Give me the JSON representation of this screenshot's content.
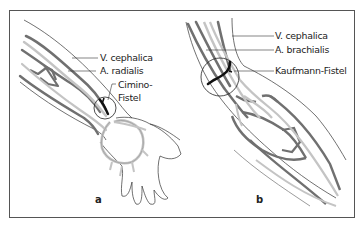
{
  "figure": {
    "panels": [
      {
        "id": "a",
        "letter": "a",
        "region": "forearm / wrist",
        "labels": {
          "vein": "V. cephalica",
          "artery": "A. radialis",
          "fistula_line1": "Cimino-",
          "fistula_line2": "Fistel"
        }
      },
      {
        "id": "b",
        "letter": "b",
        "region": "elbow",
        "labels": {
          "vein": "V. cephalica",
          "artery": "A. brachialis",
          "fistula": "Kaufmann-Fistel"
        }
      }
    ],
    "colors": {
      "vein": "#707070",
      "artery": "#c4c4c4",
      "outline": "#333333",
      "fistula": "#111111",
      "frame": "#555555"
    }
  }
}
